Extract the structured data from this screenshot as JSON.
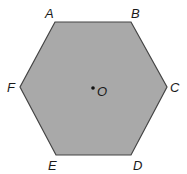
{
  "diagram": {
    "type": "regular-hexagon",
    "fill_color": "#a9a9a9",
    "stroke_color": "#444444",
    "vertices": [
      {
        "label": "A",
        "x": 55,
        "y": 22,
        "lx": 45,
        "ly": 18
      },
      {
        "label": "B",
        "x": 131,
        "y": 22,
        "lx": 131,
        "ly": 18
      },
      {
        "label": "C",
        "x": 167,
        "y": 87,
        "lx": 170,
        "ly": 92
      },
      {
        "label": "D",
        "x": 131,
        "y": 155,
        "lx": 133,
        "ly": 170
      },
      {
        "label": "E",
        "x": 56,
        "y": 155,
        "lx": 48,
        "ly": 170
      },
      {
        "label": "F",
        "x": 20,
        "y": 87,
        "lx": 7,
        "ly": 92
      }
    ],
    "center": {
      "label": "O",
      "x": 93,
      "y": 88,
      "lx": 97,
      "ly": 96
    }
  }
}
